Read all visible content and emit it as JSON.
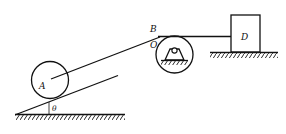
{
  "diagram": {
    "type": "mechanics-pulley-system",
    "labels": {
      "disc": "A",
      "tangent_point": "B",
      "pulley": "O",
      "block": "D",
      "angle": "θ"
    },
    "colors": {
      "line": "#111111",
      "background": "#ffffff"
    },
    "elements": [
      {
        "name": "inclined-plane",
        "description": "Plane inclined at angle θ to horizontal ground"
      },
      {
        "name": "disc-A",
        "description": "Circular disc A resting on incline"
      },
      {
        "name": "cable",
        "description": "Rope from A's center over pulley O via point B to block D"
      },
      {
        "name": "pulley-O",
        "description": "Pulley O on fixed pin support"
      },
      {
        "name": "block-D",
        "description": "Block D on horizontal ground"
      }
    ]
  }
}
